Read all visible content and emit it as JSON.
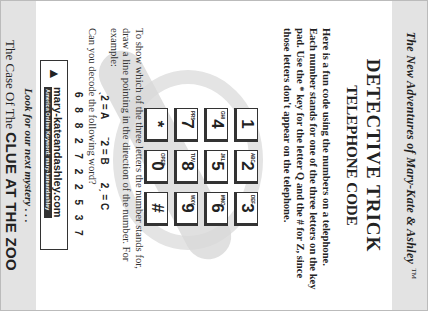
{
  "header": {
    "series_title": "The New Adventures of Mary-Kate & Ashley",
    "trademark": "TM",
    "title": "DETECTIVE TRICK",
    "subtitle": "TELEPHONE CODE"
  },
  "intro": "Here is a fun code using the numbers on a telephone. Each number stands for one of the three letters on the key pad. Use the * key for the letter Q and the # for Z, since those letters don't appear on the telephone.",
  "keypad": {
    "keys": [
      {
        "digit": "1",
        "letters": ""
      },
      {
        "digit": "2",
        "letters": "ABC"
      },
      {
        "digit": "3",
        "letters": "DEF"
      },
      {
        "digit": "4",
        "letters": "GHI"
      },
      {
        "digit": "5",
        "letters": "JKL"
      },
      {
        "digit": "6",
        "letters": "MNO"
      },
      {
        "digit": "7",
        "letters": "PRS"
      },
      {
        "digit": "8",
        "letters": "TUV"
      },
      {
        "digit": "9",
        "letters": "WXY"
      },
      {
        "digit": "*",
        "letters": ""
      },
      {
        "digit": "0",
        "letters": "OPER"
      },
      {
        "digit": "#",
        "letters": ""
      }
    ]
  },
  "instructions": "To show which of the three letters the number stands for, draw a line pointing in the direction of the number. For example:",
  "examples": [
    "ˎ2 = A",
    "ˉ2 = B",
    "2ˏ = C"
  ],
  "question": "Can you decode the following word?",
  "code": "6 8 8 2 7 2 2 5 3 7",
  "banner": {
    "url": "mary-kateandashley.com",
    "aol": "America Online Keyword: mary-kateandashley"
  },
  "footer": {
    "teaser": "Look for our next mystery . . .",
    "prefix": "The Case Of The",
    "next_title": "CLUE AT THE ZOO"
  }
}
